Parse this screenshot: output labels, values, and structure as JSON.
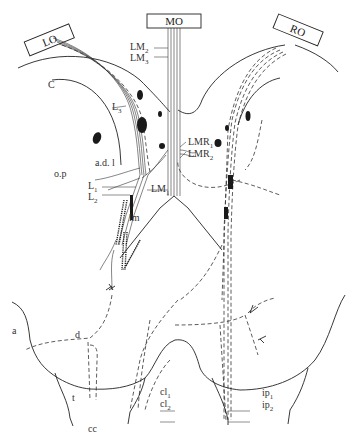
{
  "figure": {
    "type": "neuroanatomy line drawing",
    "boxes": {
      "left": "LO",
      "middle": "MO",
      "right": "RO"
    },
    "labels": {
      "LM2": "LM",
      "LM2_sub": "2",
      "LM3": "LM",
      "LM3_sub": "3",
      "C": "C",
      "L3": "L",
      "L3_sub": "3",
      "LMR1": "LMR",
      "LMR1_sub": "1",
      "LMR2": "LMR",
      "LMR2_sub": "2",
      "adl": "a.d. l",
      "op": "o.p",
      "L1": "L",
      "L1_sub": "1",
      "L2": "L",
      "L2_sub": "2",
      "LM1": "LM",
      "LM1_sub": "1",
      "lm": "lm",
      "a": "a",
      "d": "d",
      "t": "t",
      "cl1": "cl",
      "cl1_sub": "1",
      "cl2": "cl",
      "cl2_sub": "2",
      "ip1": "ip",
      "ip1_sub": "1",
      "ip2": "ip",
      "ip2_sub": "2",
      "cc": "cc"
    },
    "colors": {
      "ink": "#222222",
      "background": "#ffffff"
    }
  }
}
